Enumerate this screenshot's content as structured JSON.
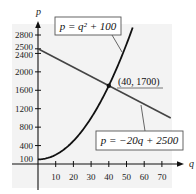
{
  "chart_data": {
    "type": "line",
    "title": "",
    "xlabel": "q",
    "ylabel": "p",
    "xlim": [
      0,
      75
    ],
    "ylim": [
      0,
      2800
    ],
    "grid": false,
    "x_ticks": [
      10,
      20,
      30,
      40,
      50,
      60,
      70
    ],
    "y_ticks": [
      100,
      400,
      800,
      1200,
      1600,
      2000,
      2400,
      2500,
      2800
    ],
    "series": [
      {
        "name": "p = q^2 + 100",
        "label": "p = q² + 100",
        "kind": "curve",
        "formula": "q^2 + 100",
        "q_range": [
          0,
          53.5
        ],
        "points": [
          [
            0,
            100
          ],
          [
            10,
            200
          ],
          [
            20,
            500
          ],
          [
            30,
            1000
          ],
          [
            40,
            1700
          ],
          [
            50,
            2600
          ]
        ]
      },
      {
        "name": "p = -20q + 2500",
        "label": "p = −20q + 2500",
        "kind": "line",
        "formula": "-20q + 2500",
        "q_range": [
          0,
          75
        ],
        "points": [
          [
            0,
            2500
          ],
          [
            40,
            1700
          ],
          [
            75,
            1000
          ]
        ]
      }
    ],
    "annotations": [
      {
        "type": "point",
        "q": 40,
        "p": 1700,
        "label": "(40, 1700)"
      }
    ]
  },
  "labels": {
    "x_axis": "q",
    "y_axis": "p",
    "supply_eq": "p = q² + 100",
    "demand_eq": "p = −20q + 2500",
    "intersection": "(40, 1700)"
  },
  "colors": {
    "background_shade": "#f3f3f3",
    "ink": "#111111"
  }
}
